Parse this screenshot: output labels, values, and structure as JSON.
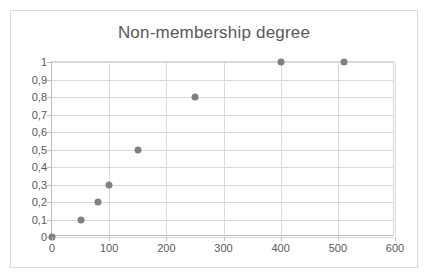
{
  "chart_data": {
    "type": "scatter",
    "title": "Non-membership degree",
    "xlabel": "",
    "ylabel": "",
    "xlim": [
      0,
      600
    ],
    "ylim": [
      0,
      1
    ],
    "x_ticks": [
      "0",
      "100",
      "200",
      "300",
      "400",
      "500",
      "600"
    ],
    "x_tick_values": [
      0,
      100,
      200,
      300,
      400,
      500,
      600
    ],
    "y_ticks": [
      "0",
      "0,1",
      "0,2",
      "0,3",
      "0,4",
      "0,5",
      "0,6",
      "0,7",
      "0,8",
      "0,9",
      "1"
    ],
    "y_tick_values": [
      0,
      0.1,
      0.2,
      0.3,
      0.4,
      0.5,
      0.6,
      0.7,
      0.8,
      0.9,
      1
    ],
    "grid": true,
    "legend": false,
    "marker_color": "#808080",
    "series": [
      {
        "name": "Non-membership degree",
        "points": [
          {
            "x": 0,
            "y": 0.0
          },
          {
            "x": 50,
            "y": 0.1
          },
          {
            "x": 80,
            "y": 0.2
          },
          {
            "x": 100,
            "y": 0.3
          },
          {
            "x": 150,
            "y": 0.5
          },
          {
            "x": 250,
            "y": 0.8
          },
          {
            "x": 400,
            "y": 1.0
          },
          {
            "x": 510,
            "y": 1.0
          }
        ]
      }
    ]
  }
}
